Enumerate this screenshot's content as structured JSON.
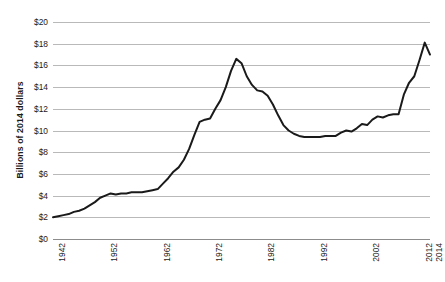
{
  "chart_data": {
    "type": "line",
    "title": "",
    "xlabel": "",
    "ylabel": "Billions of 2014 dollars",
    "xlim": [
      1942,
      2014
    ],
    "ylim": [
      0,
      20
    ],
    "y_tick_step": 2,
    "grid": true,
    "legend": "none",
    "y_ticks": [
      "$20",
      "$18",
      "$16",
      "$14",
      "$12",
      "$10",
      "$8",
      "$6",
      "$4",
      "$2",
      "$0"
    ],
    "y_tick_values": [
      20,
      18,
      16,
      14,
      12,
      10,
      8,
      6,
      4,
      2,
      0
    ],
    "x_ticks": [
      "1942",
      "1952",
      "1962",
      "1972",
      "1982",
      "1992",
      "2002",
      "2012",
      "2014"
    ],
    "x_tick_values": [
      1942,
      1952,
      1962,
      1972,
      1982,
      1992,
      2002,
      2012,
      2014
    ],
    "series": [
      {
        "name": "Spending",
        "color": "#1a1a1a",
        "x": [
          1942,
          1943,
          1944,
          1945,
          1946,
          1947,
          1948,
          1949,
          1950,
          1951,
          1952,
          1953,
          1954,
          1955,
          1956,
          1957,
          1958,
          1959,
          1960,
          1961,
          1962,
          1963,
          1964,
          1965,
          1966,
          1967,
          1968,
          1969,
          1970,
          1971,
          1972,
          1973,
          1974,
          1975,
          1976,
          1977,
          1978,
          1979,
          1980,
          1981,
          1982,
          1983,
          1984,
          1985,
          1986,
          1987,
          1988,
          1989,
          1990,
          1991,
          1992,
          1993,
          1994,
          1995,
          1996,
          1997,
          1998,
          1999,
          2000,
          2001,
          2002,
          2003,
          2004,
          2005,
          2006,
          2007,
          2008,
          2009,
          2010,
          2011,
          2012,
          2013,
          2014
        ],
        "values": [
          2.0,
          2.1,
          2.2,
          2.3,
          2.5,
          2.6,
          2.8,
          3.1,
          3.4,
          3.8,
          4.0,
          4.2,
          4.1,
          4.2,
          4.2,
          4.3,
          4.3,
          4.3,
          4.4,
          4.5,
          4.6,
          5.1,
          5.6,
          6.2,
          6.6,
          7.3,
          8.3,
          9.6,
          10.8,
          11.0,
          11.1,
          12.0,
          12.8,
          14.0,
          15.5,
          16.6,
          16.2,
          15.0,
          14.2,
          13.7,
          13.6,
          13.2,
          12.4,
          11.4,
          10.5,
          10.0,
          9.7,
          9.5,
          9.4,
          9.4,
          9.4,
          9.4,
          9.5,
          9.5,
          9.5,
          9.8,
          10.0,
          9.9,
          10.2,
          10.6,
          10.5,
          11.0,
          11.3,
          11.2,
          11.4,
          11.5,
          11.5,
          13.3,
          14.4,
          15.0,
          16.5,
          18.1,
          17.0
        ]
      }
    ]
  }
}
